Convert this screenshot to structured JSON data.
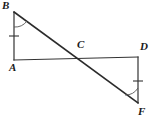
{
  "figure": {
    "width": 152,
    "height": 118,
    "background_color": "#ffffff",
    "stroke_color": "#333333",
    "label_color": "#1a1a1a"
  },
  "points": [
    {
      "id": "B",
      "label": "B",
      "x": 14,
      "y": 12,
      "label_x": 2,
      "label_y": 0
    },
    {
      "id": "A",
      "label": "A",
      "x": 14,
      "y": 60,
      "label_x": 9,
      "label_y": 62
    },
    {
      "id": "C",
      "label": "C",
      "x": 77,
      "y": 58,
      "label_x": 77,
      "label_y": 39
    },
    {
      "id": "D",
      "label": "D",
      "x": 138,
      "y": 57,
      "label_x": 140,
      "label_y": 41
    },
    {
      "id": "F",
      "label": "F",
      "x": 138,
      "y": 103,
      "label_x": 138,
      "label_y": 106
    }
  ],
  "segments": [
    {
      "id": "AB",
      "from": "B",
      "to": "A",
      "x1": 14,
      "y1": 12,
      "x2": 14,
      "y2": 60,
      "tick_marks": 1
    },
    {
      "id": "AD",
      "from": "A",
      "to": "D",
      "x1": 14,
      "y1": 60,
      "x2": 138,
      "y2": 57,
      "tick_marks": 0
    },
    {
      "id": "DF",
      "from": "D",
      "to": "F",
      "x1": 138,
      "y1": 57,
      "x2": 138,
      "y2": 103,
      "tick_marks": 1
    },
    {
      "id": "BF",
      "from": "B",
      "to": "F",
      "x1": 14,
      "y1": 12,
      "x2": 138,
      "y2": 103,
      "tick_marks": 0
    }
  ],
  "tick_marks": [
    {
      "id": "tick-AB",
      "on_segment": "AB",
      "x1": 9,
      "y1": 36,
      "x2": 19,
      "y2": 36
    },
    {
      "id": "tick-DF",
      "on_segment": "DF",
      "x1": 133,
      "y1": 81,
      "x2": 143,
      "y2": 81
    }
  ],
  "angle_arcs": [
    {
      "id": "angle-B",
      "at_point": "B",
      "between": [
        "BA",
        "BF"
      ],
      "path": "M 14 26 A 14 14 0 0 0 26 20"
    },
    {
      "id": "angle-F",
      "at_point": "F",
      "between": [
        "FB",
        "FD"
      ],
      "path": "M 126 94 A 14 14 0 0 0 138 89"
    }
  ],
  "intersection": {
    "id": "C",
    "description": "Segment BF crosses segment AD at C"
  }
}
